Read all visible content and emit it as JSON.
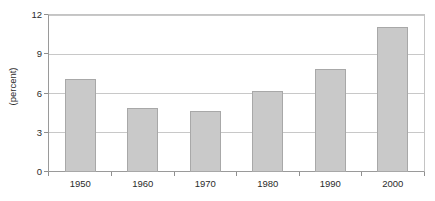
{
  "chart_data": {
    "type": "bar",
    "title": "",
    "xlabel": "",
    "ylabel": "(percent)",
    "categories": [
      "1950",
      "1960",
      "1970",
      "1980",
      "1990",
      "2000"
    ],
    "values": [
      7.1,
      4.9,
      4.7,
      6.2,
      7.9,
      11.1
    ],
    "ylim": [
      0,
      12
    ],
    "yticks": [
      "0",
      "3",
      "6",
      "9",
      "12"
    ],
    "ytick_values": [
      0,
      3,
      6,
      9,
      12
    ],
    "grid": true,
    "legend": false,
    "series": [
      {
        "name": "percent",
        "values": [
          7.1,
          4.9,
          4.7,
          6.2,
          7.9,
          11.1
        ]
      }
    ],
    "colors": {
      "bar_fill": "#c9c9c9",
      "bar_border": "#a8a8a8",
      "gridline": "#c8c8c8",
      "axis": "#9a9a9a",
      "text": "#2b2b2b",
      "background": "#ffffff"
    }
  }
}
